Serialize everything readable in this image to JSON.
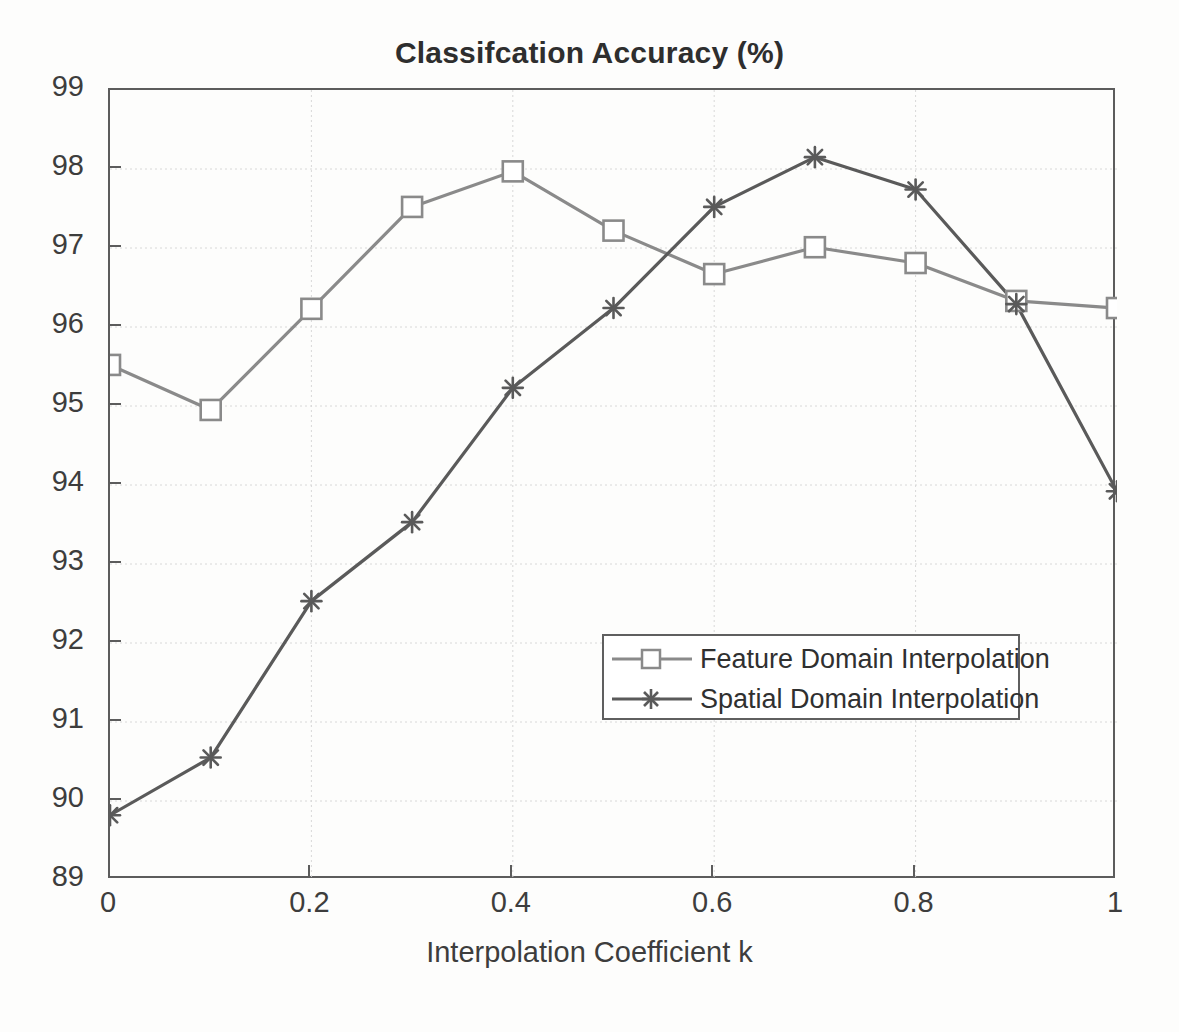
{
  "chart_data": {
    "type": "line",
    "title": "Classifcation Accuracy (%)",
    "xlabel": "Interpolation Coefficient k",
    "ylabel": "",
    "x": [
      0,
      0.1,
      0.2,
      0.3,
      0.4,
      0.5,
      0.6,
      0.7,
      0.8,
      0.9,
      1
    ],
    "xlim": [
      0,
      1
    ],
    "ylim": [
      89,
      99
    ],
    "xticks": [
      "0",
      "0.2",
      "0.4",
      "0.6",
      "0.8",
      "1"
    ],
    "xtick_values": [
      0,
      0.2,
      0.4,
      0.6,
      0.8,
      1
    ],
    "yticks": [
      "99",
      "98",
      "97",
      "96",
      "95",
      "94",
      "93",
      "92",
      "91",
      "90",
      "89"
    ],
    "ytick_values": [
      99,
      98,
      97,
      96,
      95,
      94,
      93,
      92,
      91,
      90,
      89
    ],
    "grid": true,
    "legend_position": "center-right",
    "series": [
      {
        "name": "Feature Domain Interpolation",
        "marker": "square",
        "color": "#8a8a8a",
        "values": [
          95.52,
          94.95,
          96.23,
          97.52,
          97.97,
          97.22,
          96.67,
          97.01,
          96.81,
          96.33,
          96.24
        ]
      },
      {
        "name": "Spatial Domain Interpolation",
        "marker": "star",
        "color": "#5a5a5a",
        "values": [
          89.82,
          90.55,
          92.53,
          93.53,
          95.23,
          96.24,
          97.52,
          98.15,
          97.74,
          96.29,
          93.92
        ]
      }
    ]
  },
  "legend": {
    "items": [
      {
        "label": "Feature Domain Interpolation"
      },
      {
        "label": "Spatial Domain Interpolation"
      }
    ]
  },
  "colors": {
    "series_feature": "#8a8a8a",
    "series_spatial": "#5a5a5a",
    "axis": "#5c5c5c",
    "grid": "#d8d8d8",
    "text": "#3d3d3d"
  }
}
